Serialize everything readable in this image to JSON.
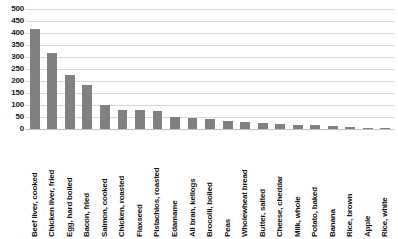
{
  "chart_data": {
    "type": "bar",
    "title": "",
    "xlabel": "",
    "ylabel": "",
    "ylim": [
      0,
      500
    ],
    "ytick_step": 50,
    "grid": true,
    "legend": null,
    "bar_color": "#808080",
    "gridline_color": "#d9d9d9",
    "yticks": [
      500,
      450,
      400,
      350,
      300,
      250,
      200,
      150,
      100,
      50,
      0
    ],
    "categories": [
      "Beef liver, cooked",
      "Chicken liver, fried",
      "Egg, hard boiled",
      "Bacon, fried",
      "Salmon, cooked",
      "Chicken, roasted",
      "Flaxseed",
      "Pistachios, roasted",
      "Edamame",
      "All bran, kellogs",
      "Brocolli, boiled",
      "Peas",
      "Wholewheat bread",
      "Butter, salted",
      "Cheese, cheddar",
      "Milk, whole",
      "Potato, baked",
      "Banana",
      "Rice, brown",
      "Apple",
      "Rice, white"
    ],
    "values": [
      415,
      317,
      225,
      183,
      100,
      80,
      78,
      75,
      50,
      46,
      40,
      32,
      28,
      25,
      22,
      18,
      15,
      12,
      10,
      6,
      3
    ]
  }
}
